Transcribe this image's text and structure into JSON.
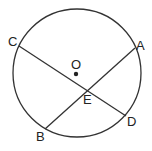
{
  "diagram": {
    "type": "circle-intersecting-chords",
    "circle": {
      "cx": 77,
      "cy": 73,
      "r": 64,
      "stroke": "#333333"
    },
    "center": {
      "label": "O",
      "x": 75,
      "y": 73
    },
    "points": {
      "A": {
        "label": "A",
        "x": 135,
        "y": 48
      },
      "B": {
        "label": "B",
        "x": 45,
        "y": 129
      },
      "C": {
        "label": "C",
        "x": 19,
        "y": 46
      },
      "D": {
        "label": "D",
        "x": 126,
        "y": 116
      },
      "E": {
        "label": "E",
        "x": 88,
        "y": 89
      }
    },
    "chords": [
      {
        "name": "AB",
        "from": "A",
        "to": "B"
      },
      {
        "name": "CD",
        "from": "C",
        "to": "D"
      }
    ]
  }
}
